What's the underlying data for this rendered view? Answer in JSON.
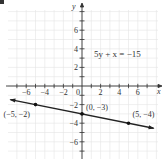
{
  "chart_data": {
    "type": "line",
    "title": "",
    "equation_label": "5y + x = −15",
    "xlabel": "x",
    "ylabel": "y",
    "xlim": [
      -7.8,
      8
    ],
    "ylim": [
      -7.8,
      9
    ],
    "grid": true,
    "x_tick_labels": [
      "−6",
      "−4",
      "−2",
      "0",
      "2",
      "4",
      "6"
    ],
    "x_tick_values": [
      -6,
      -4,
      -2,
      0,
      2,
      4,
      6
    ],
    "y_tick_labels": [
      "6",
      "4",
      "2",
      "−2",
      "−4",
      "−6"
    ],
    "y_tick_values": [
      6,
      4,
      2,
      -2,
      -4,
      -6
    ],
    "series": [
      {
        "name": "5y + x = −15",
        "x": [
          -7.7,
          7.7
        ],
        "y": [
          -1.46,
          -4.54
        ],
        "arrows": "both"
      }
    ],
    "points": [
      {
        "x": -5,
        "y": -2,
        "label": "(−5, −2)"
      },
      {
        "x": 0,
        "y": -3,
        "label": "(0, −3)"
      },
      {
        "x": 5,
        "y": -4,
        "label": "(5, −4)"
      }
    ]
  }
}
